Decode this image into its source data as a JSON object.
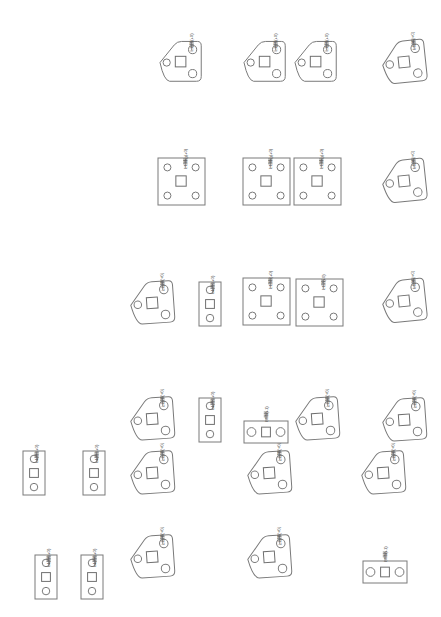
{
  "sheet": {
    "title": "Parts Layout Sheet",
    "width": 441,
    "height": 617,
    "background_color": "#ffffff",
    "line_color": "#7a7a7a",
    "text_color": "#5a5a5a"
  },
  "legend": {
    "shape_types": [
      "triangular-plate",
      "square-plate",
      "vertical-bar",
      "horizontal-bar"
    ],
    "triangular_plate_holes": 3,
    "square_plate_holes": 4,
    "vertical_bar_holes": 2,
    "horizontal_bar_holes": 2
  },
  "parts": [
    {
      "id": "p01",
      "shape": "triangular-plate",
      "x": 156,
      "y": 37,
      "w": 48,
      "h": 48,
      "rotation": 0,
      "label": "L1 75(+0)"
    },
    {
      "id": "p02",
      "shape": "triangular-plate",
      "x": 240,
      "y": 37,
      "w": 48,
      "h": 48,
      "rotation": 0,
      "label": "L1 75(+0)"
    },
    {
      "id": "p03",
      "shape": "triangular-plate",
      "x": 291,
      "y": 37,
      "w": 48,
      "h": 48,
      "rotation": 0,
      "label": "L1 75(+0)"
    },
    {
      "id": "p04",
      "shape": "triangular-plate",
      "x": 379,
      "y": 36,
      "w": 50,
      "h": 50,
      "rotation": -6,
      "label": "L1 75(+0)"
    },
    {
      "id": "p05",
      "shape": "square-plate",
      "x": 155,
      "y": 155,
      "w": 47,
      "h": 47,
      "rotation": 0,
      "label": "L1 6kg(+0)"
    },
    {
      "id": "p06",
      "shape": "square-plate",
      "x": 240,
      "y": 155,
      "w": 47,
      "h": 47,
      "rotation": 0,
      "label": "L1 6kg(+0)"
    },
    {
      "id": "p07",
      "shape": "square-plate",
      "x": 291,
      "y": 155,
      "w": 47,
      "h": 47,
      "rotation": 0,
      "label": "L1 6kg(+0)"
    },
    {
      "id": "p08",
      "shape": "triangular-plate",
      "x": 379,
      "y": 155,
      "w": 50,
      "h": 50,
      "rotation": -6,
      "label": "L1 75(+0)"
    },
    {
      "id": "p09",
      "shape": "triangular-plate",
      "x": 127,
      "y": 277,
      "w": 50,
      "h": 50,
      "rotation": -4,
      "label": "L1 28(+0)"
    },
    {
      "id": "p10",
      "shape": "vertical-bar",
      "x": 196,
      "y": 279,
      "w": 22,
      "h": 44,
      "rotation": 0,
      "label": "L1 38(+0)"
    },
    {
      "id": "p11",
      "shape": "square-plate",
      "x": 240,
      "y": 275,
      "w": 47,
      "h": 47,
      "rotation": 0,
      "label": "L1 50(+0)"
    },
    {
      "id": "p12",
      "shape": "square-plate",
      "x": 293,
      "y": 276,
      "w": 47,
      "h": 47,
      "rotation": 0,
      "label": "L1 7(+0)"
    },
    {
      "id": "p13",
      "shape": "triangular-plate",
      "x": 379,
      "y": 275,
      "w": 50,
      "h": 50,
      "rotation": -6,
      "label": "L1 75(+0)"
    },
    {
      "id": "p14",
      "shape": "triangular-plate",
      "x": 127,
      "y": 393,
      "w": 50,
      "h": 50,
      "rotation": -4,
      "label": "L1 76(+0)"
    },
    {
      "id": "p15",
      "shape": "vertical-bar",
      "x": 196,
      "y": 395,
      "w": 22,
      "h": 44,
      "rotation": 0,
      "label": "L1 38(+0)"
    },
    {
      "id": "p16",
      "shape": "horizontal-bar",
      "x": 241,
      "y": 410,
      "w": 44,
      "h": 22,
      "rotation": 0,
      "label": "L4 5(+1)"
    },
    {
      "id": "p17",
      "shape": "triangular-plate",
      "x": 292,
      "y": 393,
      "w": 50,
      "h": 50,
      "rotation": -4,
      "label": "L1 35(+0)"
    },
    {
      "id": "p18",
      "shape": "triangular-plate",
      "x": 379,
      "y": 394,
      "w": 50,
      "h": 50,
      "rotation": -4,
      "label": "L1 76(+0)"
    },
    {
      "id": "p19",
      "shape": "vertical-bar",
      "x": 20,
      "y": 448,
      "w": 22,
      "h": 44,
      "rotation": 0,
      "label": "L1 90(+0)"
    },
    {
      "id": "p20",
      "shape": "vertical-bar",
      "x": 80,
      "y": 448,
      "w": 22,
      "h": 44,
      "rotation": 0,
      "label": "L1 90(+0)"
    },
    {
      "id": "p21",
      "shape": "triangular-plate",
      "x": 127,
      "y": 447,
      "w": 50,
      "h": 50,
      "rotation": -4,
      "label": "L1 76(+0)"
    },
    {
      "id": "p22",
      "shape": "triangular-plate",
      "x": 244,
      "y": 447,
      "w": 50,
      "h": 50,
      "rotation": -4,
      "label": "L1 76(+0)"
    },
    {
      "id": "p23",
      "shape": "triangular-plate",
      "x": 358,
      "y": 447,
      "w": 50,
      "h": 50,
      "rotation": -4,
      "label": "L1 76(+0)"
    },
    {
      "id": "p24",
      "shape": "vertical-bar",
      "x": 32,
      "y": 552,
      "w": 22,
      "h": 44,
      "rotation": 0,
      "label": "L1 94(+0)"
    },
    {
      "id": "p25",
      "shape": "vertical-bar",
      "x": 78,
      "y": 552,
      "w": 22,
      "h": 44,
      "rotation": 0,
      "label": "L1 94(+0)"
    },
    {
      "id": "p26",
      "shape": "triangular-plate",
      "x": 127,
      "y": 531,
      "w": 50,
      "h": 50,
      "rotation": -4,
      "label": "L1 76(+0)"
    },
    {
      "id": "p27",
      "shape": "triangular-plate",
      "x": 244,
      "y": 531,
      "w": 50,
      "h": 50,
      "rotation": -4,
      "label": "L1 76(+0)"
    },
    {
      "id": "p28",
      "shape": "horizontal-bar",
      "x": 360,
      "y": 550,
      "w": 44,
      "h": 22,
      "rotation": 0,
      "label": "L4 5(+1)"
    }
  ]
}
